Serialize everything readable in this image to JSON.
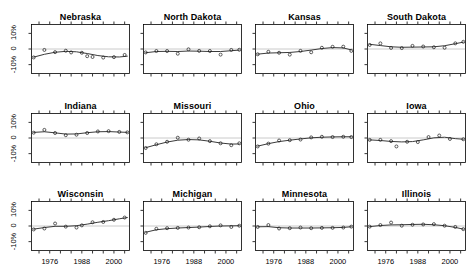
{
  "chart_data": {
    "type": "scatter",
    "title": "",
    "xlabel": "",
    "ylabel": "",
    "xlim": [
      1969,
      2006
    ],
    "ylim": [
      -16,
      16
    ],
    "grid": false,
    "legend": null,
    "zero_reference_line": 0,
    "y_ticks": [
      {
        "value": 10,
        "label": "10%"
      },
      {
        "value": 0,
        "label": "0"
      },
      {
        "value": -10,
        "label": "-10%"
      }
    ],
    "x_ticks": [
      {
        "value": 1976,
        "label": "1976"
      },
      {
        "value": 1988,
        "label": "1988"
      },
      {
        "value": 2000,
        "label": "2000"
      }
    ],
    "x_minor_ticks": [
      1972,
      1976,
      1980,
      1984,
      1988,
      1992,
      1996,
      2000,
      2004
    ],
    "layout": {
      "rows": 3,
      "cols": 4
    },
    "marker": "open-circle",
    "line": "loess-smooth",
    "panels": [
      {
        "title": "Nebraska",
        "x": [
          1970,
          1974,
          1978,
          1982,
          1984,
          1988,
          1990,
          1992,
          1996,
          2000,
          2004
        ],
        "y": [
          -5.4,
          -0.6,
          -2.0,
          -1.1,
          -2.2,
          -2.4,
          -4.6,
          -5.1,
          -5.5,
          -5.2,
          -3.8
        ],
        "fit": [
          [
            1970,
            -5.2
          ],
          [
            1974,
            -3.4
          ],
          [
            1978,
            -2.1
          ],
          [
            1982,
            -1.5
          ],
          [
            1986,
            -1.8
          ],
          [
            1990,
            -2.9
          ],
          [
            1994,
            -4.2
          ],
          [
            1998,
            -5.0
          ],
          [
            2002,
            -5.1
          ],
          [
            2005,
            -4.6
          ]
        ]
      },
      {
        "title": "North Dakota",
        "x": [
          1970,
          1974,
          1978,
          1982,
          1986,
          1990,
          1994,
          1998,
          2002,
          2005
        ],
        "y": [
          -2.2,
          -1.3,
          -1.3,
          -3.0,
          -0.2,
          -1.2,
          -1.3,
          -3.6,
          -0.6,
          -0.5
        ],
        "fit": [
          [
            1970,
            -2.4
          ],
          [
            1974,
            -1.6
          ],
          [
            1978,
            -1.5
          ],
          [
            1982,
            -1.6
          ],
          [
            1986,
            -1.3
          ],
          [
            1990,
            -1.4
          ],
          [
            1994,
            -1.6
          ],
          [
            1998,
            -1.6
          ],
          [
            2002,
            -1.1
          ],
          [
            2005,
            -0.7
          ]
        ]
      },
      {
        "title": "Kansas",
        "x": [
          1970,
          1974,
          1978,
          1982,
          1986,
          1990,
          1994,
          1998,
          2002,
          2005
        ],
        "y": [
          -3.4,
          -1.8,
          -2.4,
          -3.6,
          -1.2,
          -2.1,
          0.8,
          1.4,
          1.5,
          -1.2
        ],
        "fit": [
          [
            1970,
            -3.3
          ],
          [
            1974,
            -2.6
          ],
          [
            1978,
            -2.4
          ],
          [
            1982,
            -2.2
          ],
          [
            1986,
            -1.6
          ],
          [
            1990,
            -0.7
          ],
          [
            1994,
            0.3
          ],
          [
            1998,
            0.9
          ],
          [
            2002,
            0.7
          ],
          [
            2005,
            -0.6
          ]
        ]
      },
      {
        "title": "South Dakota",
        "x": [
          1970,
          1974,
          1978,
          1982,
          1986,
          1990,
          1994,
          1998,
          2002,
          2005
        ],
        "y": [
          2.6,
          3.6,
          0.7,
          0.6,
          2.0,
          1.6,
          1.1,
          0.8,
          3.6,
          4.6
        ],
        "fit": [
          [
            1970,
            3.0
          ],
          [
            1974,
            2.2
          ],
          [
            1978,
            1.4
          ],
          [
            1982,
            1.1
          ],
          [
            1986,
            1.2
          ],
          [
            1990,
            1.3
          ],
          [
            1994,
            1.4
          ],
          [
            1998,
            2.1
          ],
          [
            2002,
            3.4
          ],
          [
            2005,
            4.4
          ]
        ]
      },
      {
        "title": "Indiana",
        "x": [
          1970,
          1974,
          1978,
          1982,
          1986,
          1990,
          1994,
          1998,
          2002,
          2005
        ],
        "y": [
          3.4,
          5.2,
          3.2,
          1.8,
          2.1,
          3.2,
          4.2,
          4.4,
          3.9,
          3.6
        ],
        "fit": [
          [
            1970,
            3.6
          ],
          [
            1974,
            4.0
          ],
          [
            1978,
            3.3
          ],
          [
            1982,
            2.5
          ],
          [
            1986,
            2.6
          ],
          [
            1990,
            3.4
          ],
          [
            1994,
            4.0
          ],
          [
            1998,
            4.1
          ],
          [
            2002,
            3.8
          ],
          [
            2005,
            3.6
          ]
        ]
      },
      {
        "title": "Missouri",
        "x": [
          1970,
          1974,
          1978,
          1982,
          1986,
          1990,
          1994,
          1998,
          2002,
          2005
        ],
        "y": [
          -6.4,
          -4.0,
          -2.4,
          0.2,
          -1.1,
          -0.3,
          -2.0,
          -3.4,
          -4.6,
          -3.4
        ],
        "fit": [
          [
            1970,
            -6.2
          ],
          [
            1974,
            -4.3
          ],
          [
            1978,
            -2.6
          ],
          [
            1982,
            -1.4
          ],
          [
            1986,
            -1.0
          ],
          [
            1990,
            -1.2
          ],
          [
            1994,
            -2.1
          ],
          [
            1998,
            -3.2
          ],
          [
            2002,
            -3.9
          ],
          [
            2005,
            -3.8
          ]
        ]
      },
      {
        "title": "Ohio",
        "x": [
          1970,
          1974,
          1978,
          1982,
          1986,
          1990,
          1994,
          1998,
          2002,
          2005
        ],
        "y": [
          -5.4,
          -3.6,
          -1.6,
          -1.4,
          -1.0,
          0.4,
          0.8,
          0.6,
          0.8,
          0.6
        ],
        "fit": [
          [
            1970,
            -5.2
          ],
          [
            1974,
            -3.6
          ],
          [
            1978,
            -2.3
          ],
          [
            1982,
            -1.4
          ],
          [
            1986,
            -0.6
          ],
          [
            1990,
            0.1
          ],
          [
            1994,
            0.5
          ],
          [
            1998,
            0.7
          ],
          [
            2002,
            0.8
          ],
          [
            2005,
            0.8
          ]
        ]
      },
      {
        "title": "Iowa",
        "x": [
          1970,
          1974,
          1978,
          1980,
          1984,
          1988,
          1992,
          1996,
          2000,
          2005
        ],
        "y": [
          -1.2,
          -1.2,
          -2.0,
          -5.4,
          -2.4,
          -2.6,
          0.6,
          1.6,
          -0.6,
          -0.8
        ],
        "fit": [
          [
            1970,
            -1.2
          ],
          [
            1974,
            -1.6
          ],
          [
            1978,
            -2.2
          ],
          [
            1982,
            -2.5
          ],
          [
            1986,
            -2.3
          ],
          [
            1990,
            -1.2
          ],
          [
            1994,
            0.1
          ],
          [
            1998,
            0.5
          ],
          [
            2002,
            -0.4
          ],
          [
            2005,
            -0.8
          ]
        ]
      },
      {
        "title": "Wisconsin",
        "x": [
          1970,
          1974,
          1978,
          1982,
          1986,
          1988,
          1992,
          1996,
          2000,
          2004
        ],
        "y": [
          -2.2,
          -1.6,
          1.6,
          -0.4,
          -1.0,
          0.4,
          2.4,
          2.6,
          4.0,
          5.4
        ],
        "fit": [
          [
            1970,
            -2.0
          ],
          [
            1974,
            -1.0
          ],
          [
            1978,
            -0.2
          ],
          [
            1982,
            -0.2
          ],
          [
            1986,
            0.2
          ],
          [
            1990,
            1.2
          ],
          [
            1994,
            2.4
          ],
          [
            1998,
            3.4
          ],
          [
            2002,
            4.6
          ],
          [
            2005,
            5.4
          ]
        ]
      },
      {
        "title": "Michigan",
        "x": [
          1970,
          1974,
          1978,
          1982,
          1986,
          1990,
          1994,
          1998,
          2002,
          2005
        ],
        "y": [
          -4.4,
          -1.8,
          -1.4,
          -1.2,
          -1.0,
          -0.8,
          -0.2,
          0.4,
          -0.6,
          0.2
        ],
        "fit": [
          [
            1970,
            -4.0
          ],
          [
            1974,
            -2.4
          ],
          [
            1978,
            -1.7
          ],
          [
            1982,
            -1.3
          ],
          [
            1986,
            -1.0
          ],
          [
            1990,
            -0.7
          ],
          [
            1994,
            -0.3
          ],
          [
            1998,
            0.0
          ],
          [
            2002,
            0.1
          ],
          [
            2005,
            0.2
          ]
        ]
      },
      {
        "title": "Minnesota",
        "x": [
          1970,
          1974,
          1978,
          1982,
          1986,
          1990,
          1994,
          1998,
          2002,
          2005
        ],
        "y": [
          -0.6,
          0.6,
          -1.6,
          -1.4,
          -1.0,
          -1.4,
          -1.2,
          -1.2,
          -1.0,
          -0.4
        ],
        "fit": [
          [
            1970,
            -0.5
          ],
          [
            1974,
            -0.4
          ],
          [
            1978,
            -1.1
          ],
          [
            1982,
            -1.3
          ],
          [
            1986,
            -1.3
          ],
          [
            1990,
            -1.3
          ],
          [
            1994,
            -1.2
          ],
          [
            1998,
            -1.1
          ],
          [
            2002,
            -0.9
          ],
          [
            2005,
            -0.5
          ]
        ]
      },
      {
        "title": "Illinois",
        "x": [
          1970,
          1974,
          1978,
          1982,
          1986,
          1990,
          1994,
          1998,
          2002,
          2005
        ],
        "y": [
          -0.4,
          0.6,
          2.2,
          0.2,
          0.8,
          1.0,
          1.2,
          0.2,
          -0.6,
          -2.0
        ],
        "fit": [
          [
            1970,
            -0.4
          ],
          [
            1974,
            0.3
          ],
          [
            1978,
            0.7
          ],
          [
            1982,
            0.8
          ],
          [
            1986,
            1.0
          ],
          [
            1990,
            1.1
          ],
          [
            1994,
            0.8
          ],
          [
            1998,
            0.2
          ],
          [
            2002,
            -0.9
          ],
          [
            2005,
            -2.0
          ]
        ]
      }
    ]
  }
}
